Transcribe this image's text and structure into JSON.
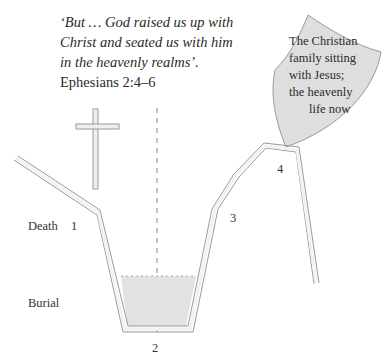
{
  "quote": {
    "lines": [
      "‘But … God raised us up with",
      "Christ and seated us with him",
      "in the heavenly realms’."
    ],
    "reference": "Ephesians 2:4–6"
  },
  "shield": {
    "lines": [
      "The Christian",
      "family sitting",
      "with Jesus;",
      "the heavenly",
      "life now"
    ]
  },
  "labels": {
    "death": "Death",
    "burial": "Burial",
    "point1": "1",
    "point2": "2",
    "point3": "3",
    "point4": "4"
  },
  "colors": {
    "stroke": "#9a9a9a",
    "fill_pale": "#eeeeee",
    "shield_fill": "#dcdcdc",
    "earth_fill": "#e4e4e4"
  }
}
